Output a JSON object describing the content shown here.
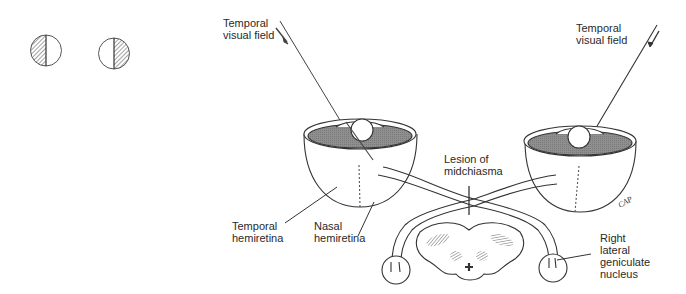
{
  "diagram": {
    "topic": "Midchiasmal lesion producing bitemporal hemianopia",
    "visual_field_icons": [
      {
        "eye": "left",
        "shaded_half": "left"
      },
      {
        "eye": "right",
        "shaded_half": "right"
      }
    ],
    "labels": {
      "left_temporal_field_line1": "Temporal",
      "left_temporal_field_line2": "visual field",
      "right_temporal_field_line1": "Temporal",
      "right_temporal_field_line2": "visual field",
      "lesion_line1": "Lesion of",
      "lesion_line2": "midchiasma",
      "temporal_hemiretina_line1": "Temporal",
      "temporal_hemiretina_line2": "hemiretina",
      "nasal_hemiretina_line1": "Nasal",
      "nasal_hemiretina_line2": "hemiretina",
      "lgn_line1": "Right",
      "lgn_line2": "lateral",
      "lgn_line3": "geniculate",
      "lgn_line4": "nucleus",
      "signature": "CAP"
    },
    "colors": {
      "line": "#333333",
      "retina_fill": "#8a8a8a",
      "hatch": "#555555",
      "background": "#ffffff"
    }
  }
}
